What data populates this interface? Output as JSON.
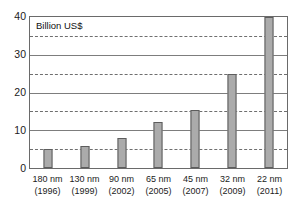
{
  "chart_data": {
    "type": "bar",
    "title": "",
    "subtitle": "",
    "axis_note": "Billion US$",
    "xlabel": "",
    "ylabel": "Billion US$",
    "categories": [
      "180 nm\n(1996)",
      "130 nm\n(1999)",
      "90 nm\n(2002)",
      "65 nm\n(2005)",
      "45 nm\n(2007)",
      "32 nm\n(2009)",
      "22 nm\n(2011)"
    ],
    "category_nodes": [
      "180 nm",
      "130 nm",
      "90 nm",
      "65 nm",
      "45 nm",
      "32 nm",
      "22 nm"
    ],
    "category_years": [
      "(1996)",
      "(1999)",
      "(2002)",
      "(2005)",
      "(2007)",
      "(2009)",
      "(2011)"
    ],
    "values": [
      5.0,
      5.7,
      7.9,
      12.3,
      15.4,
      25.0,
      40.0
    ],
    "ylim": [
      0,
      40
    ],
    "y_major_ticks": [
      0,
      10,
      20,
      30,
      40
    ],
    "y_minor_ticks": [
      5,
      15,
      25,
      35
    ],
    "y_tick_labels": [
      "0",
      "10",
      "20",
      "30",
      "40"
    ],
    "grid": "horizontal",
    "grid_major_style": "solid",
    "grid_minor_style": "dashed",
    "legend": "none",
    "legend_position": "",
    "bar_color": "#ababab",
    "bar_border_color": "#5d5d5d",
    "axis_color": "#6a6a6a",
    "grid_color": "#7d7d7d",
    "text_color": "#1b1b1b",
    "annotations": [
      "Billion US$"
    ]
  }
}
